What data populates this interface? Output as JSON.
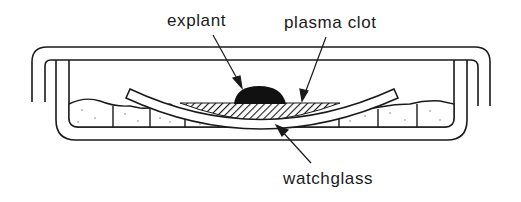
{
  "figure": {
    "type": "cross-section diagram",
    "colors": {
      "line": "#1a1a1a",
      "background": "#ffffff",
      "explant_fill": "#111111"
    },
    "labels": {
      "explant": "explant",
      "plasma_clot": "plasma clot",
      "watchglass": "watchglass"
    },
    "parts": [
      {
        "id": "lid",
        "name": "dish lid"
      },
      {
        "id": "dish",
        "name": "culture dish"
      },
      {
        "id": "cotton",
        "name": "moist cotton padding"
      },
      {
        "id": "watchglass",
        "name": "watchglass"
      },
      {
        "id": "plasma_clot",
        "name": "plasma clot"
      },
      {
        "id": "explant",
        "name": "explant"
      }
    ]
  }
}
